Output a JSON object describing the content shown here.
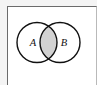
{
  "figure": {
    "type": "venn-diagram",
    "background_color": "#f4f4f4",
    "frame": {
      "border_color": "#6b6b6b",
      "fill_color": "#ffffff"
    },
    "sets": [
      {
        "label": "A",
        "position": "left",
        "center_x": 37,
        "center_y": 42.5,
        "radius": 20,
        "stroke_color": "#111111",
        "fill_color": "#ffffff",
        "label_x": 33,
        "label_y": 46
      },
      {
        "label": "B",
        "position": "right",
        "center_x": 60,
        "center_y": 42.5,
        "radius": 20,
        "stroke_color": "#111111",
        "fill_color": "#ffffff",
        "label_x": 64,
        "label_y": 46
      }
    ],
    "intersection": {
      "name": "A-intersect-B",
      "shaded": true,
      "fill_color": "#d2d2d2",
      "stroke_color": "#111111"
    }
  }
}
